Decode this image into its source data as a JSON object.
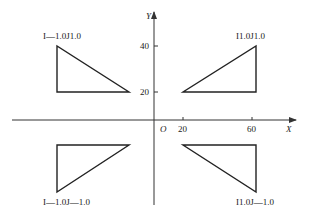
{
  "axes": {
    "x_label": "X",
    "y_label": "Y",
    "origin_label": "O",
    "x_ticks": [
      "20",
      "60"
    ],
    "y_ticks": [
      "40",
      "20"
    ]
  },
  "triangles": [
    {
      "quadrant": "upper-left",
      "label": "I—1.0J1.0"
    },
    {
      "quadrant": "upper-right",
      "label": "I1.0J1.0"
    },
    {
      "quadrant": "lower-left",
      "label": "I—1.0J—1.0"
    },
    {
      "quadrant": "lower-right",
      "label": "I1.0J—1.0"
    }
  ]
}
